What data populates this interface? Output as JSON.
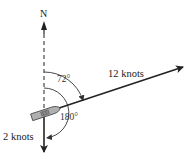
{
  "diagram": {
    "labels": {
      "north": "N",
      "angle_small": "72°",
      "angle_large": "180°",
      "vector_ship": "12 knots",
      "vector_current": "2 knots"
    },
    "vectors": [
      {
        "name": "ship-velocity",
        "label": "12 knots",
        "bearing_deg": 72,
        "magnitude_knots": 12
      },
      {
        "name": "current-velocity",
        "label": "2 knots",
        "bearing_deg": 180,
        "magnitude_knots": 2
      }
    ],
    "colors": {
      "line": "#222222",
      "boat_fill": "#aaaaaa",
      "background": "#ffffff"
    }
  }
}
